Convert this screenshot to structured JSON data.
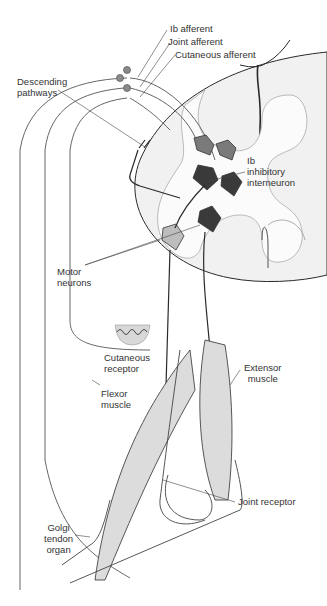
{
  "figure": {
    "colors": {
      "background": "#ffffff",
      "cord_fill": "#f1f1f1",
      "line": "#555555",
      "dark_line": "#2a2a2a",
      "muscle_fill": "#dcdcdc",
      "neuron_dark": "#3a3a3a",
      "neuron_mid": "#7a7a7a",
      "neuron_light": "#bdbdbd",
      "ganglion": "#8a8a8a"
    }
  },
  "labels": {
    "ib_afferent": "Ib afferent",
    "joint_afferent": "Joint afferent",
    "cutaneous_afferent": "Cutaneous afferent",
    "descending_pathways": "Descending\npathways",
    "ib_interneuron": "Ib\ninhibitory\ninterneuron",
    "motor_neurons": "Motor\nneurons",
    "cutaneous_receptor": "Cutaneous\nreceptor",
    "flexor_muscle": "Flexor\nmuscle",
    "extensor_muscle": "Extensor\nmuscle",
    "joint_receptor": "Joint receptor",
    "golgi_tendon_organ": "Golgi\ntendon\norgan"
  }
}
